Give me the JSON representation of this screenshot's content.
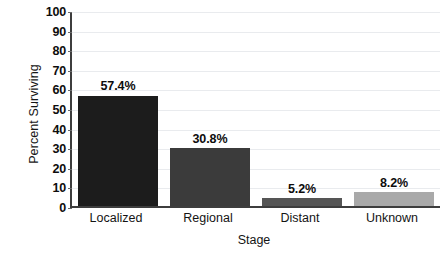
{
  "chart_data": {
    "type": "bar",
    "title": "",
    "xlabel": "Stage",
    "ylabel": "Percent Surviving",
    "categories": [
      "Localized",
      "Regional",
      "Distant",
      "Unknown"
    ],
    "values": [
      57.4,
      30.8,
      5.2,
      8.2
    ],
    "data_labels": [
      "57.4%",
      "30.8%",
      "5.2%",
      "8.2%"
    ],
    "bar_colors": [
      "#1c1c1c",
      "#3b3b3b",
      "#555555",
      "#a9a9a9"
    ],
    "ylim": [
      0,
      100
    ],
    "ytick_values": [
      100,
      90,
      80,
      70,
      60,
      50,
      40,
      30,
      20,
      10,
      0
    ],
    "ytick_labels": [
      "100",
      "90",
      "80",
      "70",
      "60",
      "50",
      "40",
      "30",
      "20",
      "10",
      "0"
    ],
    "grid": true,
    "grid_axis": "y",
    "legend": "none",
    "background": "#ffffff",
    "axis_color": "#3d3d3d"
  }
}
